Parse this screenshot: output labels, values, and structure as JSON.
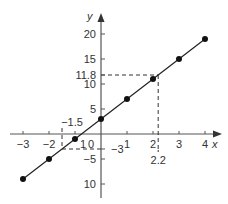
{
  "chart_data": {
    "type": "line",
    "title": "",
    "xlabel": "x",
    "ylabel": "y",
    "equation": "y = 4x + 3",
    "x": [
      -3,
      -2,
      -1,
      0,
      1,
      2,
      3,
      4
    ],
    "series": [
      {
        "name": "y = 4x + 3",
        "values": [
          -9,
          -5,
          -1,
          3,
          7,
          11,
          15,
          19
        ]
      }
    ],
    "xlim": [
      -3.3,
      4.5
    ],
    "ylim": [
      -12.5,
      24
    ],
    "x_ticks": [
      -3,
      -2,
      -1,
      0,
      1,
      2,
      3,
      4
    ],
    "x_tick_labels": [
      "−3",
      "−2",
      "1",
      "0",
      "1",
      "2",
      "3",
      "4"
    ],
    "y_ticks": [
      20,
      15,
      11.8,
      10,
      5,
      -3,
      -5,
      -10
    ],
    "y_tick_labels": [
      "20",
      "15",
      "11.8",
      "10",
      "5",
      "−3",
      "−5",
      "10"
    ],
    "annotations": [
      {
        "type": "dashed-guide",
        "x": 2.2,
        "y": 11.8,
        "x_label": "2.2",
        "y_label": "11.8"
      },
      {
        "type": "dashed-guide",
        "x": -1.5,
        "y": -3,
        "x_label": "−1.5",
        "y_label": "−3"
      }
    ],
    "grid": false,
    "legend": null
  },
  "layout": {
    "origin_px": [
      101,
      134
    ],
    "x_px_per_unit": 26,
    "y_px_per_unit": 5,
    "line_color": "#222222",
    "axis_color": "#555555",
    "marker_color": "#111111"
  }
}
